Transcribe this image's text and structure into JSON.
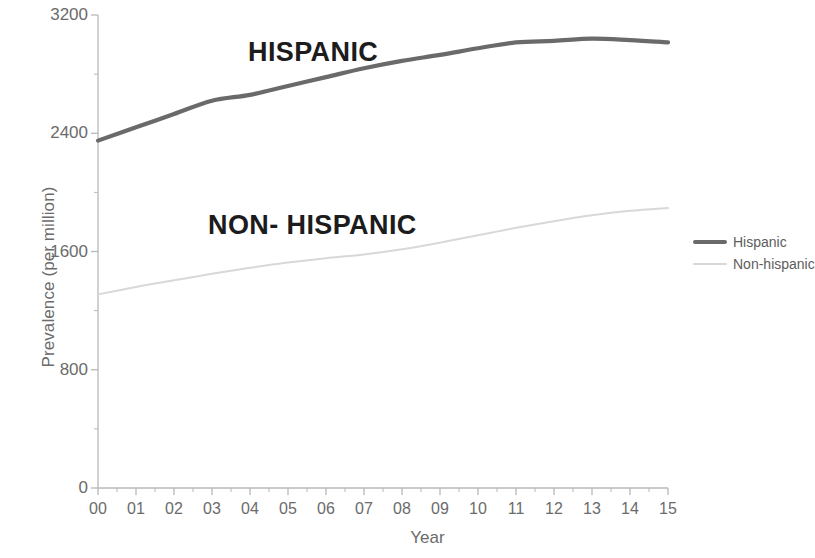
{
  "chart_data": {
    "type": "line",
    "title": "",
    "xlabel": "Year",
    "ylabel": "Prevalence (per million)",
    "x": [
      "00",
      "01",
      "02",
      "03",
      "04",
      "05",
      "06",
      "07",
      "08",
      "09",
      "10",
      "11",
      "12",
      "13",
      "14",
      "15"
    ],
    "xlim": [
      0,
      15
    ],
    "ylim": [
      0,
      3200
    ],
    "yticks": [
      0,
      800,
      1600,
      2400,
      3200
    ],
    "ytick_labels": [
      "0",
      "800",
      "1600",
      "2400",
      "3200"
    ],
    "grid": false,
    "legend_position": "right",
    "minor_ticks": true,
    "series": [
      {
        "name": "Hispanic",
        "color": "#6a6a6a",
        "width": 4.2,
        "annotation": "HISPANIC",
        "values": [
          2350,
          2440,
          2530,
          2620,
          2660,
          2720,
          2780,
          2840,
          2890,
          2930,
          2975,
          3015,
          3025,
          3040,
          3030,
          3015
        ]
      },
      {
        "name": "Non-hispanic",
        "color": "#d8d8d8",
        "width": 2.0,
        "annotation": "NON- HISPANIC",
        "values": [
          1310,
          1360,
          1405,
          1450,
          1490,
          1525,
          1555,
          1580,
          1615,
          1660,
          1710,
          1760,
          1805,
          1845,
          1875,
          1895
        ]
      }
    ]
  },
  "legend": {
    "items": [
      {
        "label": "Hispanic"
      },
      {
        "label": "Non-hispanic"
      }
    ]
  },
  "axes": {
    "x_title": "Year",
    "y_title": "Prevalence (per million)"
  },
  "colors": {
    "hispanic": "#6a6a6a",
    "non_hispanic": "#d8d8d8",
    "axis": "#b8b8b8",
    "text": "#6b6b6b",
    "annotation": "#1c1c1c"
  }
}
